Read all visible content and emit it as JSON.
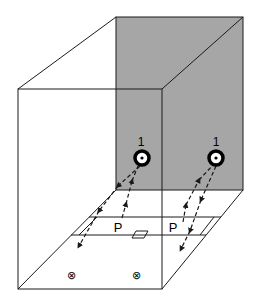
{
  "diagram": {
    "type": "3d-box-room-illumination",
    "colors": {
      "back_wall": "#a6a6a6",
      "lines": "#1a1a1a",
      "background": "#ffffff"
    },
    "sources": [
      {
        "id": "source-1-left",
        "label": "1",
        "cx": 142,
        "cy": 158
      },
      {
        "id": "source-1-right",
        "label": "1",
        "cx": 216,
        "cy": 158
      }
    ],
    "points": [
      {
        "id": "point-p-left",
        "label": "P",
        "x": 118,
        "y": 232
      },
      {
        "id": "point-p-right",
        "label": "P",
        "x": 173,
        "y": 232
      }
    ],
    "markers": [
      {
        "id": "into-page-left",
        "symbol": "⊗",
        "x": 71,
        "y": 275
      },
      {
        "id": "into-page-right",
        "symbol": "⊗",
        "x": 136,
        "y": 275
      }
    ]
  }
}
